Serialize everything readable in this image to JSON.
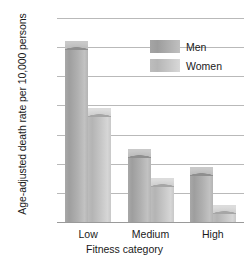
{
  "chart_data": {
    "type": "bar",
    "title": "",
    "categories": [
      "Low",
      "Medium",
      "High"
    ],
    "series": [
      {
        "name": "Men",
        "values": [
          62,
          25,
          19
        ],
        "color": "#a8a8a8"
      },
      {
        "name": "Women",
        "values": [
          39,
          15,
          6
        ],
        "color": "#c4c4c4"
      }
    ],
    "xlabel": "Fitness category",
    "ylabel": "Age-adjusted death rate per 10,000 persons",
    "ylim": [
      0,
      70
    ],
    "ytick_labels": [
      "0",
      "10",
      "20",
      "30",
      "40",
      "50",
      "60",
      "70"
    ],
    "ytick_values": [
      0,
      10,
      20,
      30,
      40,
      50,
      60,
      70
    ],
    "grid": true,
    "legend_position": "upper-right"
  },
  "axes": {
    "y_title": "Age-adjusted death rate per 10,000 persons",
    "x_title": "Fitness category"
  },
  "legend": {
    "items": [
      {
        "label": "Men",
        "swatch": "men-swatch"
      },
      {
        "label": "Women",
        "swatch": "women-swatch"
      }
    ]
  }
}
